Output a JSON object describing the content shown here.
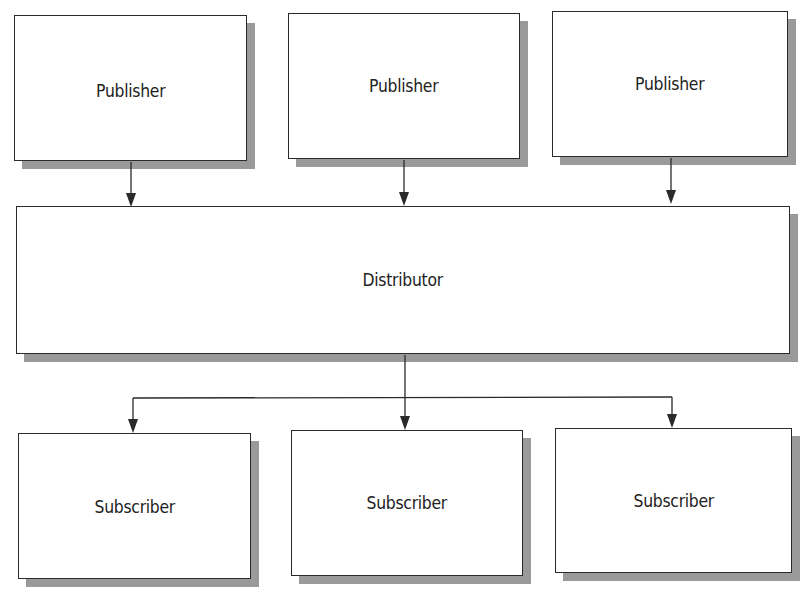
{
  "diagram": {
    "type": "publish-subscribe architecture",
    "colors": {
      "border": "#2a2a2a",
      "shadow": "#9a9a9a",
      "fill": "#ffffff",
      "text": "#222222",
      "edge": "#2a2a2a"
    },
    "publishers": [
      {
        "id": "pub-1",
        "label": "Publisher"
      },
      {
        "id": "pub-2",
        "label": "Publisher"
      },
      {
        "id": "pub-3",
        "label": "Publisher"
      }
    ],
    "distributor": {
      "id": "dist",
      "label": "Distributor"
    },
    "subscribers": [
      {
        "id": "sub-1",
        "label": "Subscriber"
      },
      {
        "id": "sub-2",
        "label": "Subscriber"
      },
      {
        "id": "sub-3",
        "label": "Subscriber"
      }
    ],
    "edges": [
      {
        "from": "pub-1",
        "to": "dist"
      },
      {
        "from": "pub-2",
        "to": "dist"
      },
      {
        "from": "pub-3",
        "to": "dist"
      },
      {
        "from": "dist",
        "to": "sub-1"
      },
      {
        "from": "dist",
        "to": "sub-2"
      },
      {
        "from": "dist",
        "to": "sub-3"
      }
    ]
  }
}
